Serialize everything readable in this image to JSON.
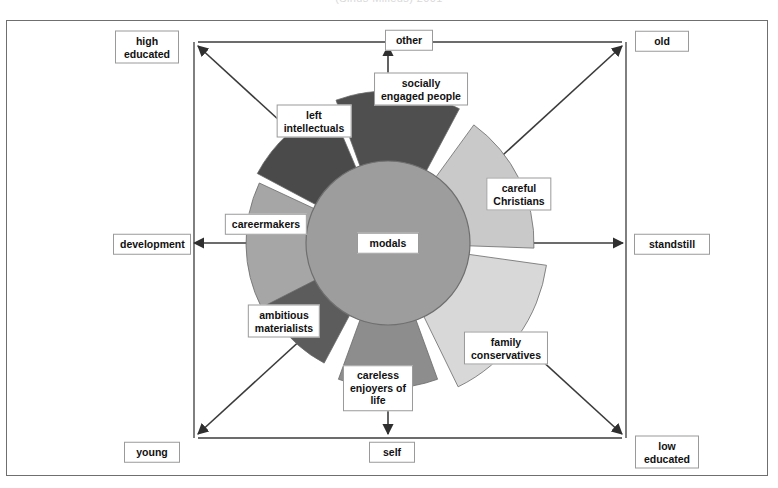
{
  "caption": "(Sinus Milieus) 2001",
  "center": {
    "label": "modals"
  },
  "axes": {
    "top_left": {
      "label": "high\neducated"
    },
    "top_center": {
      "label": "other"
    },
    "top_right": {
      "label": "old"
    },
    "middle_left": {
      "label": "development"
    },
    "middle_right": {
      "label": "standstill"
    },
    "bottom_left": {
      "label": "young"
    },
    "bottom_center": {
      "label": "self"
    },
    "bottom_right": {
      "label": "low\neducated"
    }
  },
  "colors": {
    "background": "#ffffff",
    "frame": "#6f6f6f",
    "axis_line": "#3b3b3b",
    "center_circle": "#9d9d9d",
    "center_circle_stroke": "#6a6a6a",
    "very_dark": "#4d4d4d",
    "dark": "#5b5b5b",
    "mid_dark": "#6e6e6e",
    "mid": "#8e8e8e",
    "mid_light": "#a9a9a9",
    "light": "#c6c6c6",
    "very_light": "#d8d8d8",
    "label_border": "#9a9a9a",
    "label_text": "#111111"
  },
  "chart_data": {
    "type": "pie",
    "title": "(Sinus Milieus) 2001",
    "subtype": "rose / sunburst segment diagram",
    "center_label": "modals",
    "legend": "none",
    "grid": false,
    "axis_labels": {
      "x_left": "development",
      "x_right": "standstill",
      "y_top": "other",
      "y_bottom": "self",
      "diag_top_left": "high educated",
      "diag_bottom_right": "low educated",
      "diag_top_right": "old",
      "diag_bottom_left": "young"
    },
    "categories": [
      "socially engaged people",
      "careful Christians",
      "family conservatives",
      "careless enjoyers of life",
      "ambitious materialists",
      "careermakers",
      "left intellectuals"
    ],
    "segments": [
      {
        "name": "socially engaged people",
        "label": "socially\nengaged people",
        "start_angle_deg": 62,
        "end_angle_deg": 110,
        "radius_px": 152,
        "color": "#4f4f4f",
        "label_pos": {
          "x": 421,
          "y": 89
        }
      },
      {
        "name": "careful Christians",
        "label": "careful\nChristians",
        "start_angle_deg": -2,
        "end_angle_deg": 54,
        "radius_px": 146,
        "color": "#c9c9c9",
        "label_pos": {
          "x": 519,
          "y": 194
        }
      },
      {
        "name": "family conservatives",
        "label": "family\nconservatives",
        "start_angle_deg": -64,
        "end_angle_deg": -8,
        "radius_px": 160,
        "color": "#d8d8d8",
        "label_pos": {
          "x": 506,
          "y": 348
        }
      },
      {
        "name": "careless enjoyers of life",
        "label": "careless\nenjoyers of\nlife",
        "start_angle_deg": -110,
        "end_angle_deg": -70,
        "radius_px": 145,
        "color": "#8d8d8d",
        "label_pos": {
          "x": 378,
          "y": 388
        }
      },
      {
        "name": "ambitious materialists",
        "label": "ambitious\nmaterialists",
        "start_angle_deg": -172,
        "end_angle_deg": -118,
        "radius_px": 136,
        "color": "#5c5c5c",
        "label_pos": {
          "x": 284,
          "y": 321
        }
      },
      {
        "name": "careermakers",
        "label": "careermakers",
        "start_angle_deg": 155,
        "end_angle_deg": 207,
        "radius_px": 142,
        "color": "#a6a6a6",
        "label_pos": {
          "x": 266,
          "y": 224
        }
      },
      {
        "name": "left intellectuals",
        "label": "left\nintellectuals",
        "start_angle_deg": 113,
        "end_angle_deg": 152,
        "radius_px": 148,
        "color": "#4a4a4a",
        "label_pos": {
          "x": 314,
          "y": 121
        }
      }
    ],
    "center": {
      "label": "modals",
      "radius_px": 82,
      "color": "#9d9d9d",
      "cx": 388,
      "cy": 243
    }
  }
}
